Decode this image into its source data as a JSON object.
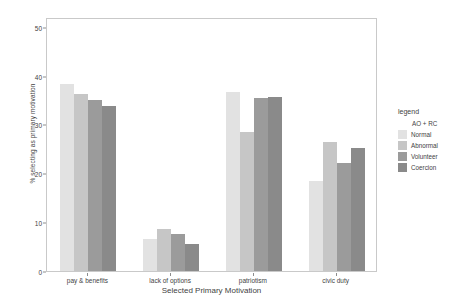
{
  "chart_data": {
    "type": "bar",
    "title": "",
    "xlabel": "Selected Primary Motivation",
    "ylabel": "% selecting as primary motivation",
    "categories": [
      "pay & benefits",
      "lack of options",
      "patriotism",
      "civic duty"
    ],
    "series": [
      {
        "name": "Normal",
        "color": "#e2e2e2",
        "values": [
          38.2,
          6.6,
          36.6,
          18.4
        ]
      },
      {
        "name": "Abnormal",
        "color": "#c6c6c6",
        "values": [
          36.3,
          8.5,
          28.4,
          26.4
        ]
      },
      {
        "name": "Volunteer",
        "color": "#9b9b9b",
        "values": [
          35.0,
          7.5,
          35.5,
          22.1
        ]
      },
      {
        "name": "Coercion",
        "color": "#8a8a8a",
        "values": [
          33.7,
          5.6,
          35.7,
          25.1
        ]
      }
    ],
    "ylim": [
      0,
      52
    ],
    "yticks": [
      0,
      10,
      20,
      30,
      40,
      50
    ],
    "ytick_labels": [
      "0",
      "10",
      "20",
      "30",
      "40",
      "50"
    ],
    "grid": false,
    "legend": {
      "title": "legend",
      "header": "AO + RC",
      "position": "right",
      "entries": [
        {
          "label": "Normal",
          "color": "#e2e2e2"
        },
        {
          "label": "Abnormal",
          "color": "#c6c6c6"
        },
        {
          "label": "Volunteer",
          "color": "#9b9b9b"
        },
        {
          "label": "Coercion",
          "color": "#8a8a8a"
        }
      ]
    },
    "panel_border_color": "#c9c9c9",
    "background_color": "#ffffff"
  }
}
